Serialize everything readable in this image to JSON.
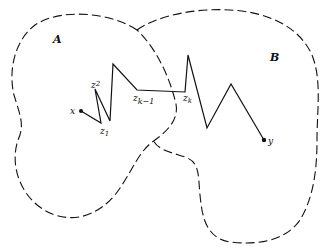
{
  "diagram": {
    "regions": [
      {
        "name": "A",
        "label": "A"
      },
      {
        "name": "B",
        "label": "B"
      }
    ],
    "points": {
      "x": "x",
      "y": "y",
      "z1": "z",
      "z1_sub": "1",
      "z2": "z",
      "z2_sub": "2",
      "zk1": "z",
      "zk1_sub": "k−1",
      "zk": "z",
      "zk_sub": "k"
    },
    "colors": {
      "stroke": "#111111",
      "background": "#ffffff"
    }
  }
}
